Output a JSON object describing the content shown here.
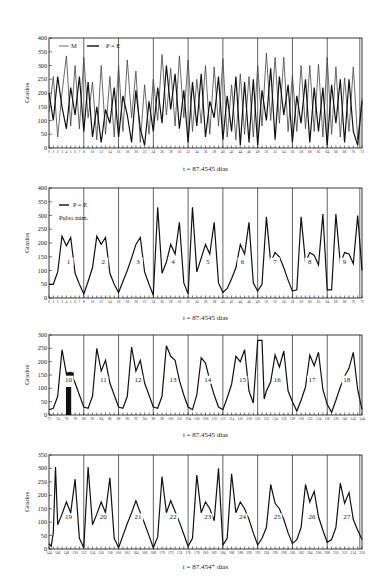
{
  "chart_data": [
    {
      "type": "line",
      "title": "",
      "caption": "t = 87.4545 días",
      "ylabel": "Grados",
      "xlabel": "",
      "ylim": [
        0,
        400
      ],
      "yticks": [
        0,
        50,
        100,
        150,
        200,
        250,
        300,
        350,
        400
      ],
      "xlim": [
        0,
        72
      ],
      "xtick_labels": [
        "0",
        "1",
        "2",
        "3",
        "4",
        "5",
        "6",
        "7",
        "8",
        "10",
        "12",
        "14",
        "16",
        "18",
        "20",
        "22",
        "24",
        "26",
        "28",
        "30",
        "32",
        "34",
        "36",
        "38",
        "40",
        "42",
        "44",
        "46",
        "48",
        "50",
        "52",
        "54",
        "56",
        "58",
        "60",
        "62",
        "64",
        "66",
        "68",
        "70",
        "72"
      ],
      "dividers": [
        8,
        16,
        24,
        32,
        40,
        48,
        56,
        64,
        71.5
      ],
      "legend": [
        "M",
        "P = E"
      ],
      "legend_position": "top-left inside",
      "series": [
        {
          "name": "M",
          "x": [
            0,
            1,
            2,
            3,
            4,
            5,
            6,
            7,
            8,
            9,
            10,
            11,
            12,
            13,
            14,
            15,
            16,
            17,
            18,
            19,
            20,
            21,
            22,
            23,
            24,
            25,
            26,
            27,
            28,
            29,
            30,
            31,
            32,
            33,
            34,
            35,
            36,
            37,
            38,
            39,
            40,
            41,
            42,
            43,
            44,
            45,
            46,
            47,
            48,
            49,
            50,
            51,
            52,
            53,
            54,
            55,
            56,
            57,
            58,
            59,
            60,
            61,
            62,
            63,
            64,
            65,
            66,
            67,
            68,
            69,
            70,
            71,
            72
          ],
          "y": [
            130,
            260,
            40,
            200,
            335,
            80,
            300,
            70,
            330,
            110,
            240,
            30,
            300,
            50,
            260,
            40,
            300,
            60,
            320,
            110,
            280,
            20,
            230,
            50,
            250,
            100,
            340,
            120,
            290,
            80,
            335,
            110,
            320,
            60,
            250,
            90,
            300,
            50,
            295,
            80,
            325,
            40,
            230,
            30,
            270,
            50,
            260,
            40,
            300,
            80,
            345,
            100,
            330,
            90,
            330,
            60,
            265,
            60,
            300,
            70,
            300,
            60,
            305,
            40,
            330,
            50,
            295,
            40,
            255,
            60,
            295,
            30,
            180
          ]
        },
        {
          "name": "P = E",
          "x": [
            0,
            1,
            2,
            3,
            4,
            5,
            6,
            7,
            8,
            9,
            10,
            11,
            12,
            13,
            14,
            15,
            16,
            17,
            18,
            19,
            20,
            21,
            22,
            23,
            24,
            25,
            26,
            27,
            28,
            29,
            30,
            31,
            32,
            33,
            34,
            35,
            36,
            37,
            38,
            39,
            40,
            41,
            42,
            43,
            44,
            45,
            46,
            47,
            48,
            49,
            50,
            51,
            52,
            53,
            54,
            55,
            56,
            57,
            58,
            59,
            60,
            61,
            62,
            63,
            64,
            65,
            66,
            67,
            68,
            69,
            70,
            71,
            72
          ],
          "y": [
            200,
            100,
            260,
            150,
            70,
            220,
            120,
            260,
            60,
            240,
            40,
            150,
            20,
            140,
            90,
            220,
            40,
            190,
            120,
            20,
            210,
            70,
            10,
            170,
            60,
            220,
            90,
            300,
            140,
            270,
            70,
            210,
            20,
            240,
            80,
            270,
            40,
            170,
            110,
            260,
            30,
            190,
            60,
            260,
            10,
            240,
            20,
            250,
            10,
            210,
            100,
            290,
            30,
            260,
            120,
            230,
            20,
            190,
            90,
            250,
            20,
            220,
            60,
            220,
            10,
            230,
            90,
            250,
            20,
            250,
            60,
            10,
            170
          ]
        }
      ]
    },
    {
      "type": "line",
      "title": "",
      "caption": "t = 87.4545 días",
      "ylabel": "Grados",
      "ylim": [
        0,
        400
      ],
      "yticks": [
        0,
        50,
        100,
        150,
        200,
        250,
        300,
        350,
        400
      ],
      "xlim": [
        0,
        72
      ],
      "xtick_labels": [
        "0",
        "1",
        "2",
        "3",
        "4",
        "5",
        "6",
        "7",
        "8",
        "10",
        "12",
        "14",
        "16",
        "18",
        "20",
        "22",
        "24",
        "26",
        "28",
        "30",
        "32",
        "34",
        "36",
        "38",
        "40",
        "42",
        "44",
        "46",
        "48",
        "50",
        "52",
        "54",
        "56",
        "58",
        "60",
        "62",
        "64",
        "66",
        "68",
        "70",
        "72"
      ],
      "dividers": [
        8,
        16,
        24,
        32,
        40,
        48,
        56,
        64,
        71.5
      ],
      "legend": [
        "P = E"
      ],
      "annotation": "Pulso núm.",
      "pulse_numbers": [
        {
          "label": "1",
          "x": 4.5,
          "y": 125
        },
        {
          "label": "2",
          "x": 12.5,
          "y": 125
        },
        {
          "label": "3",
          "x": 20.5,
          "y": 125
        },
        {
          "label": "4",
          "x": 28.5,
          "y": 125
        },
        {
          "label": "5",
          "x": 36.5,
          "y": 125
        },
        {
          "label": "6",
          "x": 44.5,
          "y": 125
        },
        {
          "label": "7",
          "x": 52,
          "y": 125
        },
        {
          "label": "8",
          "x": 60,
          "y": 125
        },
        {
          "label": "9",
          "x": 68,
          "y": 125
        }
      ],
      "series": [
        {
          "name": "P = E",
          "x": [
            0,
            1,
            2,
            3,
            4,
            5,
            6,
            7,
            8,
            9,
            10,
            11,
            12,
            13,
            14,
            15,
            16,
            17,
            18,
            19,
            20,
            21,
            22,
            23,
            24,
            25,
            26,
            27,
            28,
            29,
            30,
            31,
            32,
            33,
            34,
            35,
            36,
            37,
            38,
            39,
            40,
            41,
            42,
            43,
            44,
            45,
            46,
            47,
            48,
            49,
            50,
            51,
            52,
            53,
            54,
            55,
            56,
            57,
            58,
            59,
            60,
            61,
            62,
            63,
            64,
            65,
            66,
            67,
            68,
            69,
            70,
            71,
            72
          ],
          "y": [
            50,
            50,
            95,
            225,
            190,
            220,
            90,
            50,
            15,
            60,
            110,
            225,
            195,
            220,
            90,
            50,
            20,
            60,
            100,
            145,
            195,
            220,
            95,
            50,
            10,
            330,
            90,
            130,
            195,
            160,
            275,
            55,
            15,
            330,
            95,
            145,
            195,
            160,
            275,
            55,
            20,
            35,
            70,
            110,
            195,
            160,
            275,
            55,
            25,
            50,
            295,
            130,
            165,
            150,
            110,
            65,
            25,
            30,
            295,
            130,
            165,
            155,
            120,
            305,
            30,
            30,
            305,
            125,
            165,
            160,
            125,
            300,
            100
          ]
        }
      ]
    },
    {
      "type": "line",
      "title": "",
      "caption": "t = 87.4545 días",
      "ylabel": "Grados",
      "ylim": [
        0,
        300
      ],
      "yticks": [
        0,
        50,
        100,
        150,
        200,
        250,
        300
      ],
      "xlim": [
        72,
        144
      ],
      "xtick_labels": [
        "72",
        "74",
        "76",
        "78",
        "80",
        "82",
        "84",
        "86",
        "88",
        "90",
        "92",
        "94",
        "96",
        "98",
        "100",
        "102",
        "104",
        "106",
        "108",
        "110",
        "112",
        "114",
        "116",
        "118",
        "120",
        "122",
        "124",
        "126",
        "128",
        "130",
        "132",
        "134",
        "136",
        "138",
        "140",
        "142",
        "144"
      ],
      "dividers": [
        80,
        88,
        96,
        104,
        112,
        120,
        128,
        136,
        143.5
      ],
      "bar": {
        "x": 76.5,
        "width": 1.2,
        "lower": [
          0,
          105
        ],
        "upper": [
          140,
          160
        ]
      },
      "pulse_numbers": [
        {
          "label": "10",
          "x": 76.5,
          "y": 125
        },
        {
          "label": "11",
          "x": 84.5,
          "y": 125
        },
        {
          "label": "12",
          "x": 92.5,
          "y": 125
        },
        {
          "label": "13",
          "x": 100.5,
          "y": 125
        },
        {
          "label": "14",
          "x": 108.5,
          "y": 125
        },
        {
          "label": "15",
          "x": 116.5,
          "y": 125
        },
        {
          "label": "16",
          "x": 124.5,
          "y": 125
        },
        {
          "label": "17",
          "x": 132.5,
          "y": 125
        },
        {
          "label": "18",
          "x": 140.5,
          "y": 125
        }
      ],
      "series": [
        {
          "name": "P = E",
          "x": [
            72,
            73,
            74,
            75,
            76,
            77,
            78,
            79,
            80,
            81,
            82,
            83,
            84,
            85,
            86,
            87,
            88,
            89,
            90,
            91,
            92,
            93,
            94,
            95,
            96,
            97,
            98,
            99,
            100,
            101,
            102,
            103,
            104,
            105,
            106,
            107,
            108,
            109,
            110,
            111,
            112,
            113,
            114,
            115,
            116,
            117,
            118,
            119,
            120,
            120.5,
            121,
            121.5,
            122,
            123,
            124,
            125,
            126,
            127,
            128,
            129,
            130,
            131,
            132,
            133,
            134,
            135,
            136,
            137,
            138,
            139,
            140,
            141,
            142,
            143,
            144
          ],
          "y": [
            20,
            25,
            70,
            245,
            155,
            160,
            120,
            75,
            30,
            25,
            70,
            250,
            165,
            205,
            120,
            75,
            30,
            25,
            70,
            255,
            165,
            205,
            120,
            75,
            30,
            25,
            70,
            260,
            220,
            205,
            130,
            75,
            30,
            20,
            75,
            215,
            195,
            130,
            75,
            30,
            20,
            65,
            115,
            220,
            200,
            245,
            90,
            45,
            280,
            280,
            280,
            60,
            90,
            125,
            225,
            180,
            240,
            90,
            50,
            15,
            55,
            105,
            225,
            185,
            235,
            95,
            40,
            10,
            55,
            105,
            145,
            175,
            235,
            95,
            20
          ]
        }
      ]
    },
    {
      "type": "line",
      "title": "",
      "caption": "t = 87.454⁺ días",
      "ylabel": "Grados",
      "ylim": [
        0,
        350
      ],
      "yticks": [
        0,
        50,
        100,
        150,
        200,
        250,
        300,
        350
      ],
      "xlim": [
        144,
        216
      ],
      "xtick_labels": [
        "144",
        "146",
        "148",
        "150",
        "152",
        "154",
        "156",
        "158",
        "160",
        "162",
        "164",
        "166",
        "168",
        "170",
        "172",
        "174",
        "176",
        "178",
        "180",
        "182",
        "184",
        "186",
        "188",
        "190",
        "192",
        "194",
        "196",
        "198",
        "200",
        "202",
        "204",
        "206",
        "208",
        "210",
        "212",
        "214",
        "216"
      ],
      "dividers": [
        152,
        160,
        168,
        176,
        184,
        192,
        200,
        208,
        215.5
      ],
      "pulse_numbers": [
        {
          "label": "19",
          "x": 148.5,
          "y": 110
        },
        {
          "label": "20",
          "x": 156.5,
          "y": 110
        },
        {
          "label": "21",
          "x": 164.5,
          "y": 110
        },
        {
          "label": "22",
          "x": 172.5,
          "y": 110
        },
        {
          "label": "23",
          "x": 180.5,
          "y": 110
        },
        {
          "label": "24",
          "x": 188.5,
          "y": 110
        },
        {
          "label": "25",
          "x": 196.5,
          "y": 110
        },
        {
          "label": "26",
          "x": 204.5,
          "y": 110
        },
        {
          "label": "27",
          "x": 212.5,
          "y": 110
        }
      ],
      "series": [
        {
          "name": "P = E",
          "x": [
            144,
            144.5,
            145,
            145.5,
            146,
            147,
            148,
            149,
            150,
            151,
            152,
            153,
            154,
            155,
            156,
            157,
            158,
            159,
            160,
            161,
            162,
            163,
            164,
            165,
            166,
            167,
            168,
            169,
            170,
            171,
            172,
            173,
            174,
            175,
            176,
            177,
            178,
            179,
            180,
            181,
            182,
            183,
            184,
            185,
            186,
            187,
            188,
            189,
            190,
            191,
            192,
            193,
            194,
            195,
            196,
            197,
            198,
            199,
            200,
            201,
            202,
            203,
            204,
            205,
            206,
            207,
            208,
            209,
            210,
            211,
            212,
            213,
            214,
            215,
            216
          ],
          "y": [
            20,
            10,
            60,
            305,
            90,
            130,
            175,
            135,
            260,
            40,
            5,
            305,
            90,
            130,
            175,
            135,
            265,
            40,
            5,
            50,
            95,
            135,
            180,
            135,
            95,
            50,
            5,
            45,
            270,
            135,
            180,
            140,
            100,
            55,
            10,
            40,
            275,
            135,
            175,
            150,
            105,
            300,
            15,
            40,
            280,
            135,
            175,
            150,
            110,
            60,
            15,
            40,
            80,
            240,
            170,
            150,
            110,
            60,
            20,
            35,
            80,
            240,
            175,
            215,
            120,
            70,
            25,
            35,
            80,
            245,
            170,
            210,
            110,
            70,
            35
          ]
        }
      ]
    }
  ]
}
